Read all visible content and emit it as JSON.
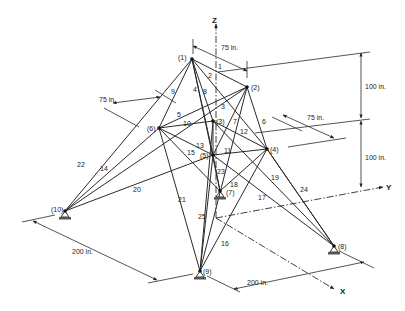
{
  "diagram": {
    "type": "25-bar space truss",
    "nodes": [
      {
        "id": "(1)",
        "x": 192,
        "y": 59,
        "lx": 178,
        "ly": 60
      },
      {
        "id": "(2)",
        "x": 247,
        "y": 87,
        "lx": 251,
        "ly": 90
      },
      {
        "id": "(3)",
        "x": 213,
        "y": 121,
        "lx": 216,
        "ly": 124
      },
      {
        "id": "(4)",
        "x": 267,
        "y": 149,
        "lx": 270,
        "ly": 152
      },
      {
        "id": "(5)",
        "x": 213,
        "y": 155,
        "lx": 200,
        "ly": 158
      },
      {
        "id": "(6)",
        "x": 159,
        "y": 128,
        "lx": 147,
        "ly": 131
      },
      {
        "id": "(7)",
        "x": 220,
        "y": 191,
        "lx": 226,
        "ly": 195
      },
      {
        "id": "(8)",
        "x": 334,
        "y": 246,
        "lx": 338,
        "ly": 249
      },
      {
        "id": "(9)",
        "x": 200,
        "y": 271,
        "lx": 203,
        "ly": 274
      },
      {
        "id": "(10)",
        "x": 65,
        "y": 211,
        "lx": 51,
        "ly": 212
      }
    ],
    "members": [
      {
        "id": "1",
        "a": 0,
        "b": 1,
        "lx": 218,
        "ly": 69
      },
      {
        "id": "2",
        "a": 0,
        "b": 2,
        "lx": 208,
        "ly": 78
      },
      {
        "id": "3",
        "a": 1,
        "b": 4,
        "lx": 221,
        "ly": 109
      },
      {
        "id": "4",
        "a": 0,
        "b": 4,
        "lx": 193,
        "ly": 92
      },
      {
        "id": "5",
        "a": 1,
        "b": 5,
        "lx": 177,
        "ly": 117
      },
      {
        "id": "6",
        "a": 1,
        "b": 3,
        "lx": 262,
        "ly": 124
      },
      {
        "id": "7",
        "a": 2,
        "b": 4,
        "lx": 233,
        "ly": 124
      },
      {
        "id": "8",
        "a": 0,
        "b": 3,
        "lx": 203,
        "ly": 94
      },
      {
        "id": "9",
        "a": 0,
        "b": 5,
        "lx": 171,
        "ly": 94
      },
      {
        "id": "10",
        "a": 5,
        "b": 2,
        "lx": 183,
        "ly": 126
      },
      {
        "id": "11",
        "a": 4,
        "b": 3,
        "lx": 224,
        "ly": 153
      },
      {
        "id": "12",
        "a": 2,
        "b": 3,
        "lx": 240,
        "ly": 134
      },
      {
        "id": "13",
        "a": 5,
        "b": 4,
        "lx": 196,
        "ly": 148
      },
      {
        "id": "14",
        "a": 5,
        "b": 9,
        "lx": 100,
        "ly": 171
      },
      {
        "id": "15",
        "a": 5,
        "b": 6,
        "lx": 187,
        "ly": 155
      },
      {
        "id": "16",
        "a": 1,
        "b": 8,
        "lx": 221,
        "ly": 246
      },
      {
        "id": "17",
        "a": 2,
        "b": 7,
        "lx": 258,
        "ly": 200
      },
      {
        "id": "18",
        "a": 3,
        "b": 6,
        "lx": 230,
        "ly": 187
      },
      {
        "id": "19",
        "a": 3,
        "b": 7,
        "lx": 271,
        "ly": 180
      },
      {
        "id": "20",
        "a": 4,
        "b": 9,
        "lx": 133,
        "ly": 192
      },
      {
        "id": "21",
        "a": 5,
        "b": 8,
        "lx": 178,
        "ly": 202
      },
      {
        "id": "22",
        "a": 0,
        "b": 9,
        "lx": 77,
        "ly": 167
      },
      {
        "id": "23",
        "a": 4,
        "b": 6,
        "lx": 217,
        "ly": 174
      },
      {
        "id": "24",
        "a": 3,
        "b": 7,
        "lx": 300,
        "ly": 192
      },
      {
        "id": "25",
        "a": 4,
        "b": 8,
        "lx": 198,
        "ly": 219
      }
    ],
    "extra_members": [
      {
        "a": 0,
        "b": 6
      },
      {
        "a": 1,
        "b": 9
      },
      {
        "a": 2,
        "b": 8
      },
      {
        "a": 3,
        "b": 8
      },
      {
        "a": 4,
        "b": 7
      }
    ],
    "supports": [
      "(7)",
      "(8)",
      "(9)",
      "(10)"
    ],
    "axes": {
      "z_label": "Z",
      "y_label": "Y",
      "x_label": "X"
    },
    "dimensions": [
      {
        "label": "75 in.",
        "lx": 221,
        "ly": 50
      },
      {
        "label": "75 in.",
        "lx": 99,
        "ly": 102
      },
      {
        "label": "75 in.",
        "lx": 307,
        "ly": 120
      },
      {
        "label": "100 in.",
        "lx": 365,
        "ly": 89
      },
      {
        "label": "100 in.",
        "lx": 365,
        "ly": 160
      },
      {
        "label": "200 in.",
        "lx": 72,
        "ly": 254
      },
      {
        "label": "200 in.",
        "lx": 247,
        "ly": 285
      }
    ]
  }
}
